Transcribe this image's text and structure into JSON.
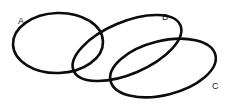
{
  "diagram": {
    "type": "venn-three-set",
    "background_color": "#ffffff",
    "stroke_color": "#0c0c0c",
    "label_color": "#1a1a1a",
    "sets": [
      {
        "id": "a",
        "label": "A",
        "label_x": 18,
        "label_y": 24,
        "cx": 58,
        "cy": 43,
        "rx": 45,
        "ry": 30,
        "rotation": -2
      },
      {
        "id": "b",
        "label": "B",
        "label_x": 162,
        "label_y": 20,
        "cx": 127,
        "cy": 48,
        "rx": 58,
        "ry": 26,
        "rotation": -23
      },
      {
        "id": "c",
        "label": "C",
        "label_x": 212,
        "label_y": 89,
        "cx": 163,
        "cy": 68,
        "rx": 54,
        "ry": 27,
        "rotation": -14
      }
    ]
  }
}
